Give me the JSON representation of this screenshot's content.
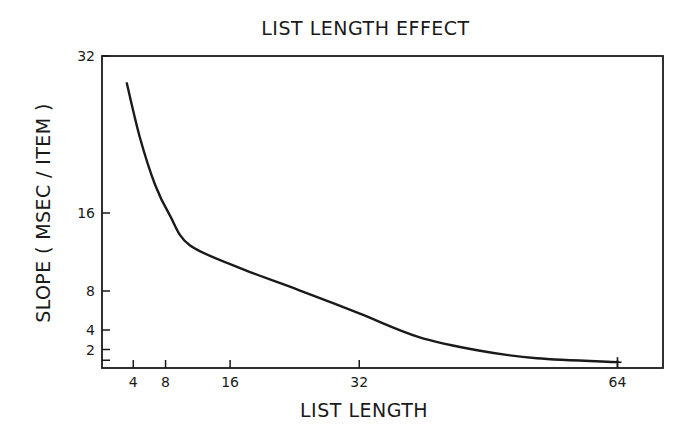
{
  "chart_data": {
    "type": "line",
    "title": "LIST LENGTH EFFECT",
    "xlabel": "LIST LENGTH",
    "ylabel": "SLOPE ( MSEC / ITEM )",
    "x_ticks": [
      4,
      8,
      16,
      32,
      64
    ],
    "y_ticks": [
      2,
      4,
      8,
      16,
      32
    ],
    "xlim": [
      0,
      69
    ],
    "ylim": [
      0,
      32
    ],
    "grid": false,
    "legend": null,
    "series": [
      {
        "name": "slope",
        "x": [
          3.2,
          4.8,
          6.7,
          8.5,
          11,
          17.7,
          24.5,
          32,
          39.3,
          46.8,
          54,
          64
        ],
        "y": [
          29.3,
          23.8,
          18.9,
          15.8,
          12.7,
          10.2,
          8.1,
          5.7,
          3.3,
          1.9,
          1.1,
          0.7
        ]
      }
    ],
    "end_marker": {
      "x": 64,
      "y": 0.7,
      "shape": "plus"
    }
  },
  "colors": {
    "ink": "#1a1a1a",
    "background": "#ffffff"
  }
}
